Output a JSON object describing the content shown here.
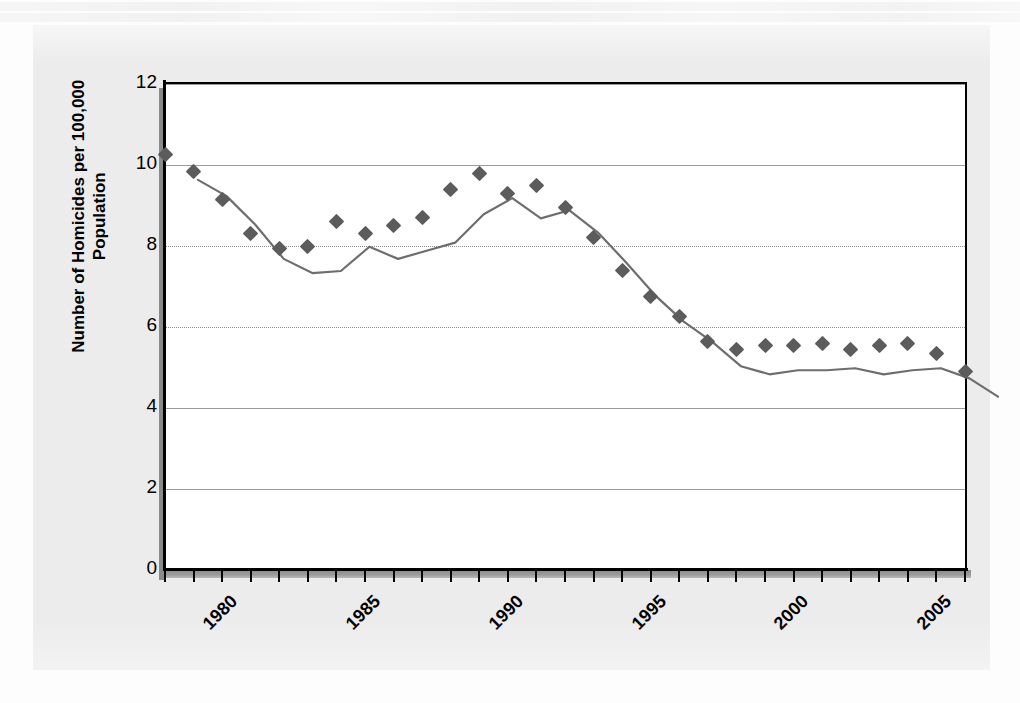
{
  "chart_data": {
    "type": "line",
    "title": "",
    "xlabel": "",
    "ylabel": "Number of Homicides per 100,000 Population",
    "ylim": [
      0,
      12
    ],
    "xlim": [
      1980,
      2008
    ],
    "yticks": [
      0,
      2,
      4,
      6,
      8,
      10,
      12
    ],
    "ytick_labels": [
      "0",
      "2",
      "4",
      "6",
      "8",
      "10",
      "12"
    ],
    "xticks": [
      1980,
      1985,
      1990,
      1995,
      2000,
      2005
    ],
    "xtick_labels": [
      "1980",
      "1985",
      "1990",
      "1995",
      "2000",
      "2005"
    ],
    "xtick_rotation": -45,
    "grid": true,
    "legend": false,
    "marker": "diamond",
    "series_color": "#5c5c5c",
    "line_color": "#6e6e6e",
    "panel_color": "#ececec",
    "plot_background": "#ffffff",
    "x": [
      1980,
      1981,
      1982,
      1983,
      1984,
      1985,
      1986,
      1987,
      1988,
      1989,
      1990,
      1991,
      1992,
      1993,
      1994,
      1995,
      1996,
      1997,
      1998,
      1999,
      2000,
      2001,
      2002,
      2003,
      2004,
      2005,
      2006,
      2007,
      2008
    ],
    "values": [
      10.2,
      9.8,
      9.1,
      8.25,
      7.9,
      7.95,
      8.55,
      8.25,
      8.45,
      8.65,
      9.35,
      9.75,
      9.25,
      9.45,
      8.9,
      8.15,
      7.35,
      6.7,
      6.2,
      5.6,
      5.4,
      5.5,
      5.5,
      5.55,
      5.4,
      5.5,
      5.55,
      5.3,
      4.85
    ],
    "series": [
      {
        "name": "Homicide rate",
        "values": [
          10.2,
          9.8,
          9.1,
          8.25,
          7.9,
          7.95,
          8.55,
          8.25,
          8.45,
          8.65,
          9.35,
          9.75,
          9.25,
          9.45,
          8.9,
          8.15,
          7.35,
          6.7,
          6.2,
          5.6,
          5.4,
          5.5,
          5.5,
          5.55,
          5.4,
          5.5,
          5.55,
          5.3,
          4.85
        ]
      }
    ]
  },
  "axis": {
    "y_title": "Number of Homicides per 100,000 Population"
  }
}
